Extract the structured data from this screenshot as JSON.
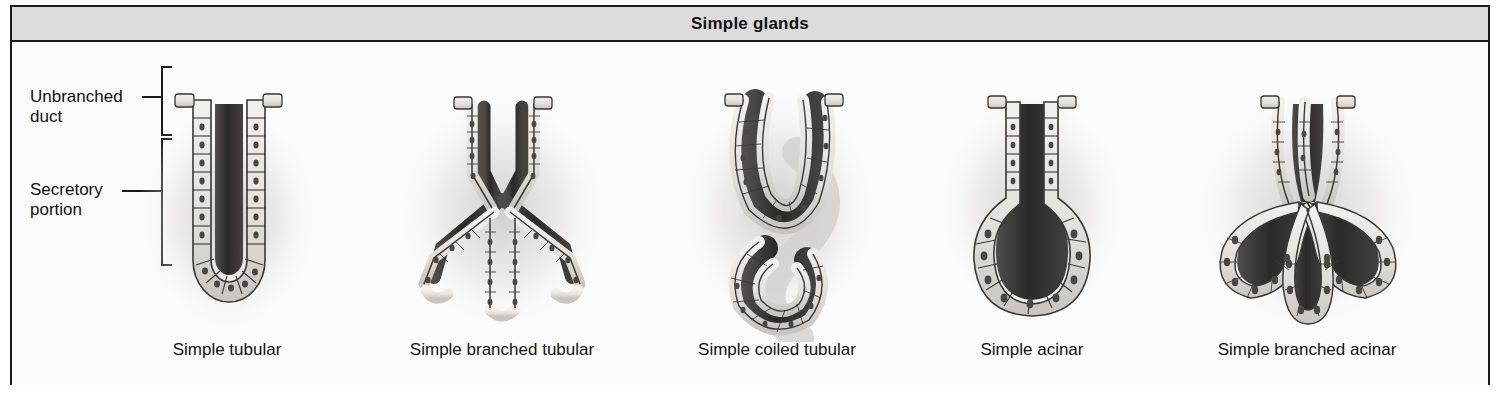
{
  "panel": {
    "title": "Simple glands"
  },
  "region_labels": {
    "unbranched_duct": "Unbranched\nduct",
    "secretory_portion": "Secretory\nportion"
  },
  "glands": [
    {
      "id": "simple-tubular",
      "caption": "Simple tubular"
    },
    {
      "id": "simple-branched-tubular",
      "caption": "Simple branched tubular"
    },
    {
      "id": "simple-coiled-tubular",
      "caption": "Simple coiled tubular"
    },
    {
      "id": "simple-acinar",
      "caption": "Simple acinar"
    },
    {
      "id": "simple-branched-acinar",
      "caption": "Simple branched acinar"
    }
  ],
  "colors": {
    "panel_border": "#1a1a1a",
    "header_background": "#dcdcdc",
    "body_background": "#fbfbfb",
    "lumen_dark": "#2f2d2c",
    "cell_fill": "#e8e6e2",
    "cell_outline": "#3a3735",
    "nucleus": "#4a4644",
    "tissue_shadow": "#cfcccb"
  }
}
